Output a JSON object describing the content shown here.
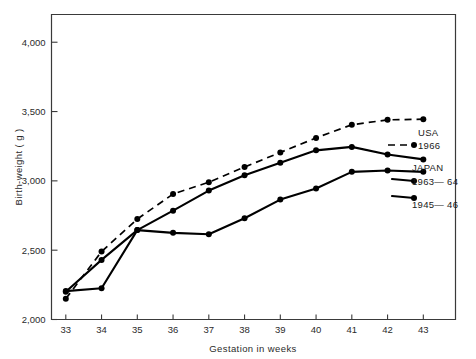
{
  "chart_data": {
    "type": "line",
    "title": "",
    "xlabel": "Gestation in weeks",
    "ylabel": "Birth-weight ( g )",
    "x": [
      33,
      34,
      35,
      36,
      37,
      38,
      39,
      40,
      41,
      42,
      43
    ],
    "xlim": [
      32.6,
      43.9
    ],
    "ylim": [
      2000,
      4200
    ],
    "xticks": [
      "33",
      "34",
      "35",
      "36",
      "37",
      "38",
      "39",
      "40",
      "41",
      "42",
      "43"
    ],
    "yticks": [
      "2,000",
      "2,500",
      "3,000",
      "3,500",
      "4,000"
    ],
    "ytick_values": [
      2000,
      2500,
      3000,
      3500,
      4000
    ],
    "grid": false,
    "legend_position": "right-inside",
    "series": [
      {
        "name": "USA 1966",
        "label_line1": "USA",
        "label_line2": "1966",
        "style": "dashed",
        "marker": "filled-circle",
        "color": "#000000",
        "values": [
          2150,
          2490,
          2725,
          2905,
          2990,
          3100,
          3205,
          3310,
          3405,
          3440,
          3445
        ]
      },
      {
        "name": "JAPAN 1963-64",
        "label_line1": "JAPAN",
        "label_line2": "1963— 64",
        "style": "solid",
        "marker": "filled-circle",
        "color": "#000000",
        "values": [
          2200,
          2430,
          2645,
          2785,
          2930,
          3040,
          3130,
          3220,
          3245,
          3190,
          3155
        ]
      },
      {
        "name": "JAPAN 1945-46",
        "label_line1": "",
        "label_line2": "1945— 46",
        "style": "solid",
        "marker": "filled-circle",
        "color": "#000000",
        "values": [
          2205,
          2225,
          2645,
          2625,
          2615,
          2730,
          2865,
          2945,
          3065,
          3075,
          3065
        ]
      }
    ]
  },
  "legend": {
    "usa_title": "USA",
    "usa_year": "1966",
    "japan_title": "JAPAN",
    "japan_years_1": "1963— 64",
    "japan_years_2": "1945— 46"
  },
  "axes": {
    "x_title": "Gestation in weeks",
    "y_title": "Birth-weight ( g )"
  }
}
